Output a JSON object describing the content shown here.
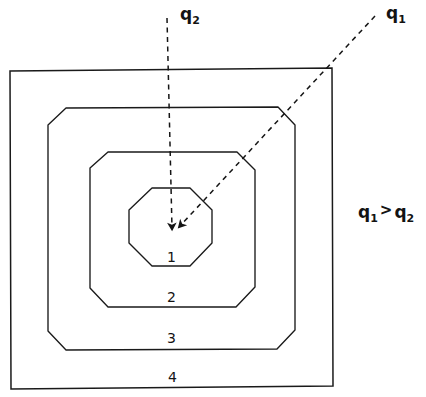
{
  "diagram": {
    "background_color": "#ffffff",
    "stroke_color": "#1a1a1a",
    "contours": [
      {
        "id": 1,
        "label": "1",
        "shape": "octagon",
        "label_x": 172,
        "label_y": 259,
        "points": "152,188 190,188 212,210 212,243 190,266 152,266 129,243 129,210"
      },
      {
        "id": 2,
        "label": "2",
        "shape": "chamfered-square",
        "label_x": 172,
        "label_y": 299,
        "points": "108,152 237,152 255,170 255,287 236,307 108,307 90,288 90,168"
      },
      {
        "id": 3,
        "label": "3",
        "shape": "chamfered-square",
        "label_x": 172,
        "label_y": 340,
        "points": "66,108 278,107 295,125 295,330 277,349 66,350 48,331 48,125"
      },
      {
        "id": 4,
        "label": "4",
        "shape": "square",
        "label_x": 173,
        "label_y": 379,
        "points": "10,71 332,68 333,386 11,389"
      }
    ],
    "center_point": {
      "x": 172,
      "y": 228
    },
    "vectors": [
      {
        "name": "q2",
        "label": "q",
        "subscript": "2",
        "style": "dashed",
        "direction": "vertical-down",
        "tail_x": 167,
        "tail_y": 18,
        "head_x": 172,
        "head_y": 228,
        "label_x": 180,
        "label_y": 6
      },
      {
        "name": "q1",
        "label": "q",
        "subscript": "1",
        "style": "dashed",
        "direction": "diagonal-down-left",
        "tail_x": 375,
        "tail_y": 16,
        "head_x": 180,
        "head_y": 226,
        "label_x": 386,
        "label_y": 5
      }
    ],
    "annotation": {
      "text": "q1 > q2",
      "left_symbol": "q",
      "left_sub": "1",
      "operator": ">",
      "right_symbol": "q",
      "right_sub": "2",
      "x": 358,
      "y": 204
    }
  }
}
